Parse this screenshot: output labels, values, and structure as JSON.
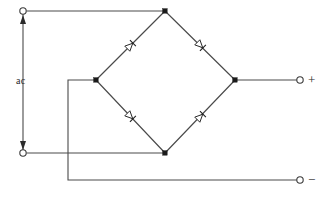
{
  "diagram": {
    "type": "schematic",
    "width": 321,
    "height": 197,
    "background_color": "#ffffff",
    "wire_color": "#4a4a4a",
    "node_color": "#1a1a1a"
  },
  "labels": {
    "ac_source": "ac",
    "dc_positive": "+",
    "dc_negative": "−"
  },
  "terminals": [
    {
      "id": "ac-top",
      "label": "ac",
      "x": 23,
      "y": 11,
      "style": "open-circle"
    },
    {
      "id": "ac-bottom",
      "label": "ac",
      "x": 23,
      "y": 153,
      "style": "open-circle"
    },
    {
      "id": "dc-plus",
      "label": "+",
      "x": 300,
      "y": 80,
      "style": "open-circle"
    },
    {
      "id": "dc-minus",
      "label": "−",
      "x": 300,
      "y": 180,
      "style": "open-circle"
    }
  ],
  "nodes": [
    {
      "id": "node-top",
      "x": 165,
      "y": 11
    },
    {
      "id": "node-left",
      "x": 96,
      "y": 80
    },
    {
      "id": "node-right",
      "x": 235,
      "y": 80
    },
    {
      "id": "node-bottom",
      "x": 165,
      "y": 153
    }
  ],
  "diodes": [
    {
      "id": "diode-top-left",
      "position": "upper-left",
      "x": 129,
      "y": 47,
      "direction": "toward-top-node"
    },
    {
      "id": "diode-top-right",
      "position": "upper-right",
      "x": 201,
      "y": 47,
      "direction": "toward-right-node"
    },
    {
      "id": "diode-bottom-left",
      "position": "lower-left",
      "x": 129,
      "y": 118,
      "direction": "toward-left-node"
    },
    {
      "id": "diode-bottom-right",
      "position": "lower-right",
      "x": 201,
      "y": 118,
      "direction": "toward-right-node"
    }
  ],
  "arrows": {
    "ac_up": {
      "x": 23,
      "y": 18,
      "direction": "up"
    },
    "ac_down": {
      "x": 23,
      "y": 146,
      "direction": "down"
    }
  }
}
